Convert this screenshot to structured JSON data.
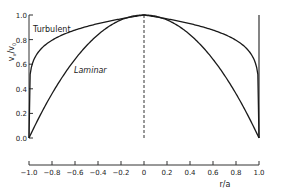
{
  "chart_data": {
    "type": "line",
    "title": "",
    "xlabel": "r/a",
    "ylabel": "v_x/v_0",
    "xlim": [
      -1.0,
      1.0
    ],
    "ylim": [
      0.0,
      1.0
    ],
    "grid": false,
    "x_ticks": [
      "-1.0",
      "-0.8",
      "-0.6",
      "-0.4",
      "-0.2",
      "0",
      "0.2",
      "0.4",
      "0.6",
      "0.8",
      "1.0"
    ],
    "y_ticks": [
      "0.0",
      "0.2",
      "0.4",
      "0.6",
      "0.8",
      "1.0"
    ],
    "annotations": [
      {
        "text": "Turbulent",
        "near_x": -0.9,
        "near_y": 0.88
      },
      {
        "text": "Laminar",
        "near_x": -0.6,
        "near_y": 0.52
      }
    ],
    "reference_lines": [
      {
        "type": "vertical",
        "x": 0.0,
        "style": "dashed"
      },
      {
        "type": "vertical",
        "x": 1.0,
        "style": "solid"
      }
    ],
    "series": [
      {
        "name": "Turbulent",
        "x": [
          -1.0,
          -0.99,
          -0.95,
          -0.9,
          -0.8,
          -0.6,
          -0.4,
          -0.2,
          0.0,
          0.2,
          0.4,
          0.6,
          0.8,
          0.9,
          0.95,
          0.99,
          1.0
        ],
        "values": [
          0.0,
          0.52,
          0.65,
          0.72,
          0.79,
          0.88,
          0.93,
          0.97,
          1.0,
          0.97,
          0.93,
          0.88,
          0.79,
          0.72,
          0.65,
          0.52,
          0.0
        ]
      },
      {
        "name": "Laminar",
        "x": [
          -1.0,
          -0.8,
          -0.6,
          -0.4,
          -0.2,
          0.0,
          0.2,
          0.4,
          0.6,
          0.8,
          1.0
        ],
        "values": [
          0.0,
          0.36,
          0.64,
          0.84,
          0.96,
          1.0,
          0.96,
          0.84,
          0.64,
          0.36,
          0.0
        ]
      }
    ]
  },
  "labels": {
    "turbulent": "Turbulent",
    "laminar": "Laminar",
    "xlabel": "r/a",
    "ylabel_main": "v",
    "ylabel_sub1": "x",
    "ylabel_mid": "/v",
    "ylabel_sub2": "0"
  },
  "colors": {
    "line": "#1a1a1a",
    "axis": "#333333",
    "text": "#222222"
  }
}
